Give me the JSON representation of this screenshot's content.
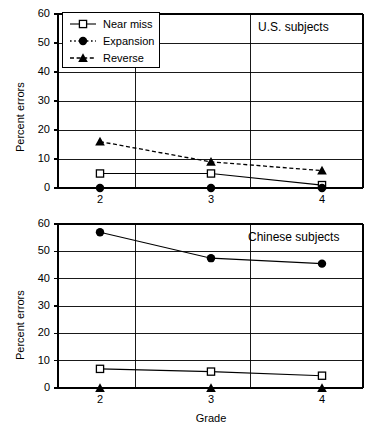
{
  "figure": {
    "xlabel": "Grade",
    "ylabel_top": "Percent errors",
    "ylabel_bottom": "Percent errors"
  },
  "legend": {
    "items": [
      {
        "label": "Near miss",
        "marker": "open-square",
        "line": "solid"
      },
      {
        "label": "Expansion",
        "marker": "filled-circle",
        "line": "dotted"
      },
      {
        "label": "Reverse",
        "marker": "filled-triangle",
        "line": "dashed"
      }
    ]
  },
  "panels": [
    {
      "title": "U.S. subjects"
    },
    {
      "title": "Chinese subjects"
    }
  ],
  "yticks": [
    "0",
    "10",
    "20",
    "30",
    "40",
    "50",
    "60"
  ],
  "xticks": [
    "2",
    "3",
    "4"
  ],
  "chart_data": [
    {
      "type": "line",
      "title": "U.S. subjects",
      "xlabel": "Grade",
      "ylabel": "Percent errors",
      "categories": [
        "2",
        "3",
        "4"
      ],
      "x": [
        2,
        3,
        4
      ],
      "ylim": [
        0,
        60
      ],
      "yticks": [
        0,
        10,
        20,
        30,
        40,
        50,
        60
      ],
      "grid": true,
      "legend_position": "top-left",
      "series": [
        {
          "name": "Near miss",
          "values": [
            5,
            5,
            1
          ],
          "marker": "open-square",
          "line": "solid"
        },
        {
          "name": "Expansion",
          "values": [
            0,
            0,
            0
          ],
          "marker": "filled-circle",
          "line": "dotted"
        },
        {
          "name": "Reverse",
          "values": [
            16,
            9,
            6
          ],
          "marker": "filled-triangle",
          "line": "dashed"
        }
      ]
    },
    {
      "type": "line",
      "title": "Chinese subjects",
      "xlabel": "Grade",
      "ylabel": "Percent errors",
      "categories": [
        "2",
        "3",
        "4"
      ],
      "x": [
        2,
        3,
        4
      ],
      "ylim": [
        0,
        60
      ],
      "yticks": [
        0,
        10,
        20,
        30,
        40,
        50,
        60
      ],
      "grid": true,
      "legend_position": "none",
      "series": [
        {
          "name": "Near miss",
          "values": [
            7,
            6,
            4.5
          ],
          "marker": "open-square",
          "line": "solid"
        },
        {
          "name": "Expansion",
          "values": [
            57,
            47.5,
            45.5
          ],
          "marker": "filled-circle",
          "line": "solid"
        },
        {
          "name": "Reverse",
          "values": [
            0,
            0,
            0
          ],
          "marker": "filled-triangle",
          "line": "none"
        }
      ]
    }
  ]
}
